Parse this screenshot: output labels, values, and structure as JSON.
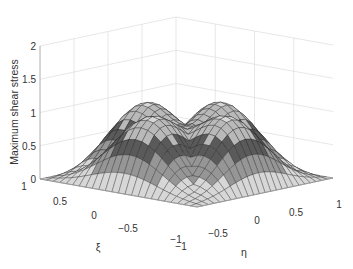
{
  "chart_data": {
    "type": "surface3d",
    "title": "",
    "xlabel": "ξ",
    "ylabel": "η",
    "zlabel": "Maximum shear stress",
    "xlim": [
      -1,
      1
    ],
    "ylim": [
      -1,
      1
    ],
    "zlim": [
      0,
      2
    ],
    "x_ticks": [
      "-1",
      "-0.5",
      "0",
      "0.5",
      "1"
    ],
    "y_ticks": [
      "-1",
      "-0.5",
      "0",
      "0.5",
      "1"
    ],
    "z_ticks": [
      "0",
      "0.5",
      "1",
      "1.5",
      "2"
    ],
    "grid": true,
    "colormap": "gray (faceted)",
    "mesh_resolution": 24
  },
  "axes": {
    "z_label": "Maximum shear stress",
    "x_label": "ξ",
    "y_label": "η"
  }
}
